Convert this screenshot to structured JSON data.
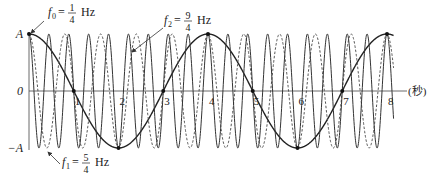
{
  "chart_data": {
    "type": "line",
    "title": "",
    "xlabel": "(秒)",
    "ylabel": "",
    "xlim": [
      0,
      8.4
    ],
    "ylim": [
      -1,
      1
    ],
    "x_ticks": [
      1,
      2,
      3,
      4,
      5,
      6,
      7,
      8
    ],
    "x_tick_labels": [
      "1",
      "2",
      "3",
      "4",
      "5",
      "6",
      "7",
      "8"
    ],
    "y_ticks": [
      1,
      0,
      -1
    ],
    "y_tick_labels": [
      "A",
      "0",
      "−A"
    ],
    "grid": false,
    "series": [
      {
        "name": "f0",
        "label": "f₀ = 1/4 Hz",
        "frequency": 0.25,
        "amplitude": 1,
        "function": "cos",
        "style": "solid",
        "width": 1.4,
        "color": "#222222",
        "marked_points": [
          [
            0,
            1
          ],
          [
            1,
            0
          ],
          [
            2,
            -1
          ],
          [
            3,
            0
          ],
          [
            4,
            1
          ],
          [
            5,
            0
          ],
          [
            6,
            -1
          ],
          [
            7,
            0
          ],
          [
            8,
            1
          ]
        ]
      },
      {
        "name": "f1",
        "label": "f₁ = 5/4 Hz",
        "frequency": 1.25,
        "amplitude": 1,
        "function": "cos",
        "style": "dashed",
        "width": 1.0,
        "color": "#555555"
      },
      {
        "name": "f2",
        "label": "f₂ = 9/4 Hz",
        "frequency": 2.25,
        "amplitude": 1,
        "function": "cos",
        "style": "solid",
        "width": 1.0,
        "color": "#333333"
      }
    ],
    "annotations": [
      {
        "sym": "f",
        "sub": "0",
        "num": "1",
        "den": "4",
        "unit": "Hz",
        "text_x": 48,
        "text_y": 16,
        "arrow_from": [
          44,
          21
        ],
        "arrow_to": [
          31,
          33
        ]
      },
      {
        "sym": "f",
        "sub": "2",
        "num": "9",
        "den": "4",
        "unit": "Hz",
        "text_x": 164,
        "text_y": 24,
        "arrow_from": [
          163,
          28
        ],
        "arrow_to": [
          132,
          52
        ]
      },
      {
        "sym": "f",
        "sub": "1",
        "num": "5",
        "den": "4",
        "unit": "Hz",
        "text_x": 62,
        "text_y": 166,
        "arrow_from": [
          60,
          164
        ],
        "arrow_to": [
          48,
          152
        ]
      }
    ]
  },
  "layout": {
    "x0_px": 29,
    "px_per_unit": 44.75,
    "y_zero_px": 91,
    "amp_px": 57,
    "axis_end_px": 407
  }
}
